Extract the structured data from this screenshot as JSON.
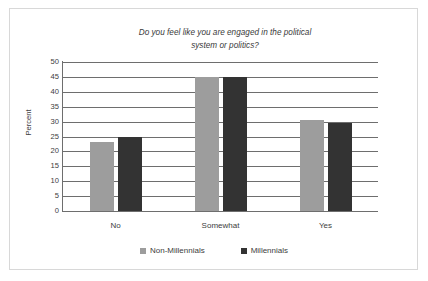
{
  "chart_data": {
    "type": "bar",
    "title": "Do you feel like you are engaged in the political system or politics?",
    "title_line_1": "Do you feel like you are engaged in the political",
    "title_line_2": "system or politics?",
    "xlabel": "",
    "ylabel": "Percent",
    "categories": [
      "No",
      "Somewhat",
      "Yes"
    ],
    "series": [
      {
        "name": "Non-Millennials",
        "color": "#9d9d9d",
        "values": [
          23,
          45,
          30.5
        ]
      },
      {
        "name": "Millennials",
        "color": "#333333",
        "values": [
          25,
          45,
          29.5
        ]
      }
    ],
    "ylim": [
      0,
      50
    ],
    "ytick_step": 5,
    "yticks": [
      50,
      45,
      40,
      35,
      30,
      25,
      20,
      15,
      10,
      5,
      0
    ],
    "ytick_labels": [
      "50",
      "45",
      "40",
      "35",
      "30",
      "25",
      "20",
      "15",
      "10",
      "5",
      "0"
    ],
    "grid": true,
    "grid_axis": "y",
    "legend_position": "bottom",
    "frame_border_color": "#d8d8d8",
    "axis_color": "#6e6e6e"
  }
}
